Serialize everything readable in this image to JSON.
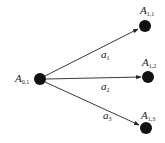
{
  "diagram": {
    "type": "tree",
    "background": "#ffffff",
    "node_color": "#111111",
    "edge_color": "#222222",
    "nodes": [
      {
        "id": "A01",
        "base": "A",
        "sub": "0,1",
        "x": 40,
        "y": 79
      },
      {
        "id": "A11",
        "base": "A",
        "sub": "1,1",
        "x": 145,
        "y": 26
      },
      {
        "id": "A12",
        "base": "A",
        "sub": "1,2",
        "x": 148,
        "y": 77
      },
      {
        "id": "A13",
        "base": "A",
        "sub": "1,3",
        "x": 146,
        "y": 128
      }
    ],
    "edges": [
      {
        "from": "A01",
        "to": "A11",
        "base": "a",
        "sub": "1"
      },
      {
        "from": "A01",
        "to": "A12",
        "base": "a",
        "sub": "2"
      },
      {
        "from": "A01",
        "to": "A13",
        "base": "a",
        "sub": "3"
      }
    ]
  }
}
